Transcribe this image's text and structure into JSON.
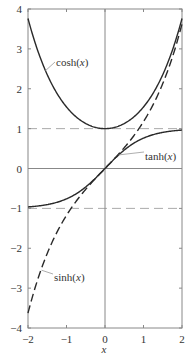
{
  "chart_data": {
    "type": "line",
    "title": "",
    "xlabel": "x",
    "ylabel": "",
    "xlim": [
      -2,
      2
    ],
    "ylim": [
      -4,
      4
    ],
    "grid": false,
    "legend": "inline labels",
    "x_ticks": [
      -2,
      -1,
      0,
      1,
      2
    ],
    "y_ticks": [
      -4,
      -3,
      -2,
      -1,
      0,
      1,
      2,
      3,
      4
    ],
    "x_tick_labels": [
      "−2",
      "−1",
      "0",
      "1",
      "2"
    ],
    "y_tick_labels": [
      "−4",
      "−3",
      "−2",
      "−1",
      "0",
      "1",
      "2",
      "3",
      "4"
    ],
    "reference_lines": [
      {
        "orientation": "horizontal",
        "y": 1,
        "style": "dashed"
      },
      {
        "orientation": "horizontal",
        "y": -1,
        "style": "dashed"
      },
      {
        "orientation": "horizontal",
        "y": 0,
        "style": "solid"
      },
      {
        "orientation": "vertical",
        "x": 0,
        "style": "solid"
      }
    ],
    "x": [
      -2,
      -1.5,
      -1,
      -0.5,
      0,
      0.5,
      1,
      1.5,
      2
    ],
    "series": [
      {
        "name": "cosh(x)",
        "label": "cosh(x)",
        "style": "solid",
        "values": [
          3.762,
          2.352,
          1.543,
          1.128,
          1.0,
          1.128,
          1.543,
          2.352,
          3.762
        ]
      },
      {
        "name": "sinh(x)",
        "label": "sinh(x)",
        "style": "dashed",
        "values": [
          -3.627,
          -2.129,
          -1.175,
          -0.521,
          0.0,
          0.521,
          1.175,
          2.129,
          3.627
        ]
      },
      {
        "name": "tanh(x)",
        "label": "tanh(x)",
        "style": "solid",
        "values": [
          -0.964,
          -0.905,
          -0.762,
          -0.462,
          0.0,
          0.462,
          0.762,
          0.905,
          0.964
        ]
      }
    ],
    "annotations": [
      {
        "text": "cosh(x)",
        "points_to": {
          "x": -1.55,
          "y": 2.45
        }
      },
      {
        "text": "sinh(x)",
        "points_to": {
          "x": -1.65,
          "y": -2.55
        }
      },
      {
        "text": "tanh(x)",
        "points_to": {
          "x": 0.35,
          "y": 0.34
        }
      }
    ]
  },
  "labels": {
    "cosh": {
      "prefix": "cosh(",
      "var": "x",
      "suffix": ")"
    },
    "sinh": {
      "prefix": "sinh(",
      "var": "x",
      "suffix": ")"
    },
    "tanh": {
      "prefix": "tanh(",
      "var": "x",
      "suffix": ")"
    },
    "xaxis": "x"
  },
  "colors": {
    "curve": "#2a2a2a",
    "frame": "#777777",
    "reference": "#aaaaaa",
    "text": "#333333"
  }
}
